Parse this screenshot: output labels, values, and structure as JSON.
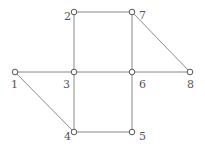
{
  "graph": {
    "nodes": [
      {
        "id": "1",
        "label": "1",
        "x": 15,
        "y": 72,
        "lx": 11,
        "ly": 88
      },
      {
        "id": "2",
        "label": "2",
        "x": 74,
        "y": 12,
        "lx": 64,
        "ly": 20
      },
      {
        "id": "3",
        "label": "3",
        "x": 74,
        "y": 72,
        "lx": 63,
        "ly": 88
      },
      {
        "id": "4",
        "label": "4",
        "x": 74,
        "y": 132,
        "lx": 64,
        "ly": 140
      },
      {
        "id": "5",
        "label": "5",
        "x": 132,
        "y": 132,
        "lx": 139,
        "ly": 140
      },
      {
        "id": "6",
        "label": "6",
        "x": 132,
        "y": 72,
        "lx": 139,
        "ly": 88
      },
      {
        "id": "7",
        "label": "7",
        "x": 132,
        "y": 12,
        "lx": 139,
        "ly": 19
      },
      {
        "id": "8",
        "label": "8",
        "x": 190,
        "y": 72,
        "lx": 187,
        "ly": 88
      }
    ],
    "edges": [
      [
        "1",
        "3"
      ],
      [
        "1",
        "4"
      ],
      [
        "2",
        "3"
      ],
      [
        "2",
        "7"
      ],
      [
        "3",
        "4"
      ],
      [
        "3",
        "6"
      ],
      [
        "4",
        "5"
      ],
      [
        "5",
        "6"
      ],
      [
        "6",
        "7"
      ],
      [
        "6",
        "8"
      ],
      [
        "7",
        "8"
      ]
    ]
  }
}
